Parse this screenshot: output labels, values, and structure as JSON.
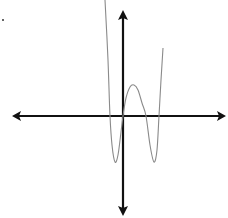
{
  "chart_data": {
    "type": "line",
    "title": "",
    "xlabel": "",
    "ylabel": "",
    "grid": false,
    "legend": null,
    "x_intercepts_approx_px": [
      110,
      123,
      146,
      159
    ],
    "series": [
      {
        "name": "f(x)",
        "color": "#8a8a8a",
        "points_px": [
          [
            105,
            0
          ],
          [
            108,
            60
          ],
          [
            110,
            116
          ],
          [
            112,
            145
          ],
          [
            115,
            162
          ],
          [
            118,
            155
          ],
          [
            121,
            132
          ],
          [
            123,
            116
          ],
          [
            126,
            98
          ],
          [
            130,
            87
          ],
          [
            134,
            85
          ],
          [
            138,
            90
          ],
          [
            142,
            103
          ],
          [
            146,
            116
          ],
          [
            150,
            145
          ],
          [
            154,
            162
          ],
          [
            157,
            150
          ],
          [
            159,
            116
          ],
          [
            161,
            80
          ],
          [
            163,
            48
          ]
        ],
        "features": {
          "local_min_1_px": [
            115,
            162
          ],
          "local_max_px": [
            134,
            85
          ],
          "local_min_2_px": [
            154,
            162
          ],
          "passes_through_origin": true
        }
      }
    ],
    "axes": {
      "color": "#111111",
      "x_axis": {
        "y_px": 116,
        "from_px": 12,
        "to_px": 226,
        "arrows": "both"
      },
      "y_axis": {
        "x_px": 123,
        "from_px": 10,
        "to_px": 216,
        "arrows": "both"
      }
    }
  },
  "decorations": {
    "stray_dot_px": [
      3,
      20
    ]
  }
}
